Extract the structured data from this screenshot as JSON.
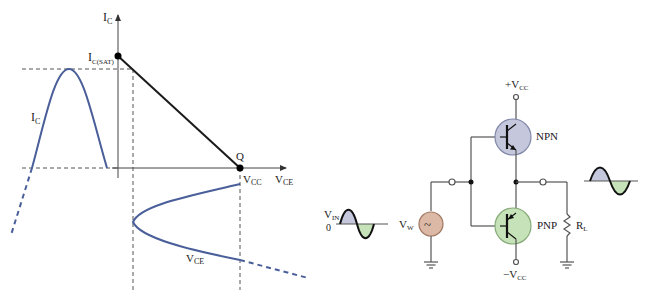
{
  "colors": {
    "curve": "#4a5f9a",
    "line": "#1a1a1a",
    "wire": "#555555",
    "dash": "#555555",
    "npn_fill": "#c5c8dc",
    "pnp_fill": "#c6e2b8",
    "source_fill": "#dcb9a6",
    "wave_pos_fill": "#c5c8dc",
    "wave_neg_fill": "#c6e2b8"
  },
  "graph": {
    "ic_axis_label": {
      "main": "I",
      "sub": "C"
    },
    "ic_sat_label": {
      "main": "I",
      "sub": "C(SAT)"
    },
    "q_label": "Q",
    "vcc_label": {
      "main": "V",
      "sub": "CC"
    },
    "vce_axis_label": {
      "main": "V",
      "sub": "CE"
    },
    "ic_curve_label": {
      "main": "I",
      "sub": "C"
    },
    "vce_curve_label": {
      "main": "V",
      "sub": "CE"
    }
  },
  "circuit": {
    "plus_vcc": {
      "main": "+V",
      "sub": "CC"
    },
    "minus_vcc": {
      "main": "−V",
      "sub": "CC"
    },
    "npn_label": "NPN",
    "pnp_label": "PNP",
    "source_label": {
      "main": "V",
      "sub": "W"
    },
    "source_glyph": "~",
    "vin_label": {
      "main": "V",
      "sub": "IN"
    },
    "zero_label": "0",
    "load_label": {
      "main": "R",
      "sub": "L"
    }
  }
}
